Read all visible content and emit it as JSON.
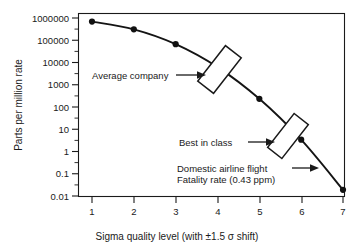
{
  "chart_data": {
    "type": "line",
    "title": "",
    "xlabel": "Sigma quality level (with ±1.5 σ shift)",
    "ylabel": "Parts per million rate",
    "xlim": [
      0.65,
      7.35
    ],
    "ylim_log10": [
      -2,
      6
    ],
    "grid": false,
    "legend": "none",
    "y_scale": "log",
    "x": [
      1,
      2,
      3,
      4,
      5,
      6,
      7
    ],
    "values": [
      691462,
      308538,
      66807,
      6210,
      233,
      3.4,
      0.019
    ],
    "series": [
      {
        "name": "Parts per million rate",
        "values": [
          691462,
          308538,
          66807,
          6210,
          233,
          3.4,
          0.019
        ]
      }
    ],
    "xticklabels": [
      "1",
      "2",
      "3",
      "4",
      "5",
      "6",
      "7"
    ],
    "yticklabels": [
      "1000000",
      "100000",
      "10000",
      "1000",
      "100",
      "10",
      "1",
      "0.1",
      "0.01"
    ],
    "ytickvalues": [
      1000000,
      100000,
      10000,
      1000,
      100,
      10,
      1,
      0.1,
      0.01
    ],
    "annotations": [
      {
        "id": "average-company",
        "label": "Average company",
        "lines": [
          "Average company"
        ],
        "band_x_range": [
          3.55,
          4.35
        ],
        "band_y_range": [
          2000,
          12000
        ]
      },
      {
        "id": "best-in-class",
        "label": "Best in class",
        "lines": [
          "Best in class"
        ],
        "band_x_range": [
          5.5,
          6.25
        ],
        "band_y_range": [
          2,
          25
        ]
      },
      {
        "id": "domestic-airline-flight",
        "label": "Domestic airline flight Fatality rate (0.43 ppm)",
        "lines": [
          "Domestic airline flight",
          "Fatality rate (0.43 ppm)"
        ],
        "point_x": 6.6,
        "point_y": 0.43
      }
    ]
  },
  "axes": {
    "y_title": "Parts per million rate",
    "x_title": "Sigma quality level (with ±1.5 σ shift)",
    "y_ticks": [
      {
        "label": "1000000"
      },
      {
        "label": "100000"
      },
      {
        "label": "10000"
      },
      {
        "label": "1000"
      },
      {
        "label": "100"
      },
      {
        "label": "10"
      },
      {
        "label": "1"
      },
      {
        "label": "0.1"
      },
      {
        "label": "0.01"
      }
    ],
    "x_ticks": [
      {
        "label": "1"
      },
      {
        "label": "2"
      },
      {
        "label": "3"
      },
      {
        "label": "4"
      },
      {
        "label": "5"
      },
      {
        "label": "6"
      },
      {
        "label": "7"
      }
    ]
  },
  "callouts": {
    "average_company": "Average company",
    "best_in_class": "Best in class",
    "airline_line1": "Domestic airline flight",
    "airline_line2": "Fatality rate (0.43 ppm)"
  },
  "colors": {
    "ink": "#1a1a1a",
    "curve": "#141414",
    "background": "#ffffff"
  }
}
